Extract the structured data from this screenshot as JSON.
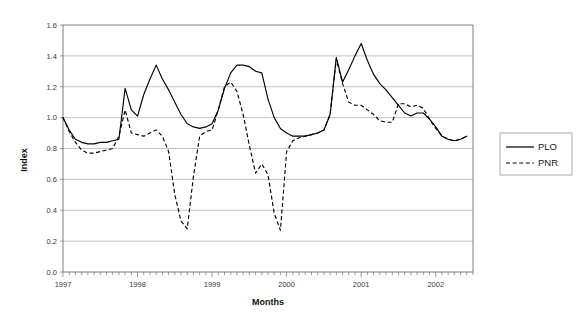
{
  "chart_data": {
    "type": "line",
    "title": "",
    "xlabel": "Months",
    "ylabel": "Index",
    "ylim": [
      0.0,
      1.6
    ],
    "ytick_labels": [
      "0.0",
      "0.2",
      "0.4",
      "0.6",
      "0.8",
      "1.0",
      "1.2",
      "1.4",
      "1.6"
    ],
    "ytick_values": [
      0.0,
      0.2,
      0.4,
      0.6,
      0.8,
      1.0,
      1.2,
      1.4,
      1.6
    ],
    "xtick_labels": [
      "1997",
      "1998",
      "1999",
      "2000",
      "2001",
      "2002"
    ],
    "xtick_values": [
      0,
      12,
      24,
      36,
      48,
      60
    ],
    "xlim": [
      0,
      66
    ],
    "x_minor_tick_interval_months": 1,
    "grid": "horizontal",
    "legend_position": "right-outside",
    "legend_entries": [
      {
        "name": "PLO",
        "style": "solid"
      },
      {
        "name": "PNR",
        "style": "dashed"
      }
    ],
    "x": [
      0,
      1,
      2,
      3,
      4,
      5,
      6,
      7,
      8,
      9,
      10,
      11,
      12,
      13,
      14,
      15,
      16,
      17,
      18,
      19,
      20,
      21,
      22,
      23,
      24,
      25,
      26,
      27,
      28,
      29,
      30,
      31,
      32,
      33,
      34,
      35,
      36,
      37,
      38,
      39,
      40,
      41,
      42,
      43,
      44,
      45,
      46,
      47,
      48,
      49,
      50,
      51,
      52,
      53,
      54,
      55,
      56,
      57,
      58,
      59,
      60,
      61,
      62,
      63,
      64,
      65
    ],
    "series": [
      {
        "name": "PLO",
        "style": "solid",
        "values": [
          1.0,
          0.92,
          0.86,
          0.84,
          0.83,
          0.83,
          0.84,
          0.84,
          0.85,
          0.86,
          1.19,
          1.05,
          1.01,
          1.15,
          1.25,
          1.34,
          1.25,
          1.18,
          1.1,
          1.02,
          0.96,
          0.94,
          0.93,
          0.94,
          0.96,
          1.05,
          1.19,
          1.29,
          1.34,
          1.34,
          1.33,
          1.3,
          1.29,
          1.12,
          1.0,
          0.93,
          0.9,
          0.88,
          0.88,
          0.88,
          0.89,
          0.9,
          0.92,
          1.02,
          1.39,
          1.23,
          1.31,
          1.4,
          1.48,
          1.37,
          1.28,
          1.22,
          1.18,
          1.13,
          1.08,
          1.03,
          1.01,
          1.03,
          1.03,
          0.99,
          0.94,
          0.88,
          0.86,
          0.85,
          0.86,
          0.88
        ]
      },
      {
        "name": "PNR",
        "style": "dashed",
        "values": [
          1.0,
          0.91,
          0.84,
          0.79,
          0.77,
          0.77,
          0.78,
          0.79,
          0.8,
          0.88,
          1.05,
          0.9,
          0.89,
          0.88,
          0.9,
          0.92,
          0.88,
          0.78,
          0.5,
          0.33,
          0.28,
          0.62,
          0.88,
          0.91,
          0.92,
          1.05,
          1.2,
          1.23,
          1.17,
          1.02,
          0.82,
          0.64,
          0.7,
          0.63,
          0.38,
          0.27,
          0.78,
          0.85,
          0.87,
          0.88,
          0.89,
          0.9,
          0.92,
          1.02,
          1.38,
          1.22,
          1.1,
          1.08,
          1.08,
          1.05,
          1.02,
          0.98,
          0.97,
          0.97,
          1.09,
          1.09,
          1.07,
          1.08,
          1.06,
          0.99,
          0.93,
          0.88,
          0.86,
          0.85,
          0.86,
          0.88
        ]
      }
    ],
    "notes": {
      "pnr_deep_dips": [
        {
          "period": "1998",
          "min_value": 0.28
        },
        {
          "period": "1999",
          "min_value": 0.26
        },
        {
          "period": "2001",
          "min_value": 0.2
        },
        {
          "period": "2002",
          "min_value": 0.26
        }
      ],
      "plo_max_value": 1.48,
      "plo_max_period": "2000"
    }
  },
  "axes": {
    "y_title": "Index",
    "x_title": "Months"
  },
  "legend": {
    "items": [
      {
        "label": "PLO"
      },
      {
        "label": "PNR"
      }
    ]
  }
}
